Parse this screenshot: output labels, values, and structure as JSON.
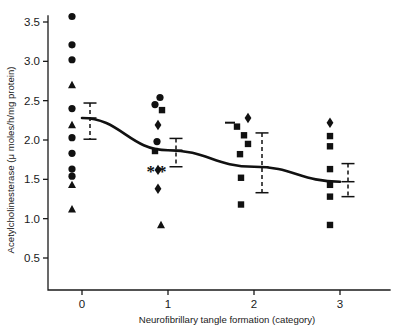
{
  "chart_data": {
    "type": "scatter",
    "title": "",
    "xlabel": "Neurofibrillary tangle formation (category)",
    "ylabel": "Acetylcholinesterase (μ moles/h/mg protein)",
    "xlim": [
      -0.35,
      3.35
    ],
    "ylim": [
      0.05,
      3.72
    ],
    "xticks": [
      0,
      1,
      2,
      3
    ],
    "xtick_labels": [
      "0",
      "1",
      "2",
      "3"
    ],
    "yticks": [
      0.5,
      1.0,
      1.5,
      2.0,
      2.5,
      3.0,
      3.5
    ],
    "ytick_labels": [
      "0.5",
      "1.0",
      "1.5",
      "2.0",
      "2.5",
      "3.0",
      "3.5"
    ],
    "grid": false,
    "legend": null,
    "categories": [
      0,
      1,
      2,
      3
    ],
    "series": [
      {
        "name": "category-0",
        "x": 0,
        "points": [
          {
            "value": 3.57,
            "marker": "circle"
          },
          {
            "value": 3.21,
            "marker": "circle"
          },
          {
            "value": 3.02,
            "marker": "circle"
          },
          {
            "value": 2.7,
            "marker": "triangle"
          },
          {
            "value": 2.4,
            "marker": "circle"
          },
          {
            "value": 2.19,
            "marker": "triangle"
          },
          {
            "value": 2.03,
            "marker": "circle"
          },
          {
            "value": 1.83,
            "marker": "circle"
          },
          {
            "value": 1.63,
            "marker": "circle"
          },
          {
            "value": 1.54,
            "marker": "circle"
          },
          {
            "value": 1.43,
            "marker": "triangle"
          },
          {
            "value": 1.12,
            "marker": "triangle"
          }
        ],
        "mean": 2.28,
        "error_upper": 2.47,
        "error_lower": 2.01
      },
      {
        "name": "category-1",
        "x": 1,
        "points": [
          {
            "value": 2.54,
            "marker": "circle"
          },
          {
            "value": 2.45,
            "marker": "circle"
          },
          {
            "value": 2.38,
            "marker": "square"
          },
          {
            "value": 2.19,
            "marker": "diamond"
          },
          {
            "value": 1.98,
            "marker": "circle"
          },
          {
            "value": 1.86,
            "marker": "square"
          },
          {
            "value": 1.62,
            "marker": "diamond"
          },
          {
            "value": 1.38,
            "marker": "diamond"
          },
          {
            "value": 0.92,
            "marker": "triangle"
          }
        ],
        "mean": 1.87,
        "error_upper": 2.02,
        "error_lower": 1.66,
        "significance": "**"
      },
      {
        "name": "category-2",
        "x": 2,
        "points": [
          {
            "value": 2.28,
            "marker": "diamond"
          },
          {
            "value": 2.22,
            "marker": "dash"
          },
          {
            "value": 2.17,
            "marker": "square"
          },
          {
            "value": 2.06,
            "marker": "square"
          },
          {
            "value": 1.95,
            "marker": "square"
          },
          {
            "value": 1.82,
            "marker": "square"
          },
          {
            "value": 1.52,
            "marker": "square"
          },
          {
            "value": 1.18,
            "marker": "square"
          }
        ],
        "mean": 1.66,
        "error_upper": 2.09,
        "error_lower": 1.33
      },
      {
        "name": "category-3",
        "x": 3,
        "points": [
          {
            "value": 2.22,
            "marker": "diamond"
          },
          {
            "value": 2.05,
            "marker": "square"
          },
          {
            "value": 1.92,
            "marker": "square"
          },
          {
            "value": 1.63,
            "marker": "square"
          },
          {
            "value": 1.43,
            "marker": "square"
          },
          {
            "value": 1.28,
            "marker": "square"
          },
          {
            "value": 0.92,
            "marker": "square"
          }
        ],
        "mean": 1.47,
        "error_upper": 1.7,
        "error_lower": 1.28
      }
    ],
    "trend_line": {
      "x": [
        0,
        1,
        2,
        3
      ],
      "y": [
        2.28,
        1.87,
        1.66,
        1.47
      ]
    },
    "colors": {
      "marker": "#111111",
      "axis": "#1a1a1a",
      "trend": "#111111",
      "background": "#ffffff"
    }
  }
}
